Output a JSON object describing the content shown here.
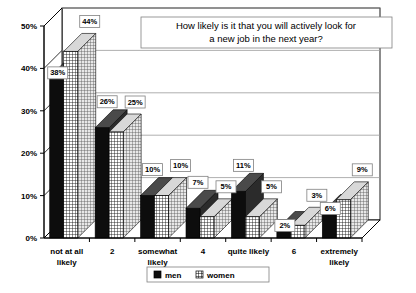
{
  "chart_data": {
    "type": "bar",
    "title": "How likely is it that you will actively look for a new job in the next year?",
    "title_line1": "How likely is it that you will actively look for",
    "title_line2": "a new job in the next year?",
    "xlabel": "",
    "ylabel": "",
    "ylim": [
      0,
      50
    ],
    "ytick_labels": [
      "0%",
      "10%",
      "20%",
      "30%",
      "40%",
      "50%"
    ],
    "ytick_values": [
      0,
      10,
      20,
      30,
      40,
      50
    ],
    "grid": true,
    "legend_position": "bottom-center",
    "categories": [
      "not at all likely",
      "2",
      "somewhat likely",
      "4",
      "quite likely",
      "6",
      "extremely likely"
    ],
    "category_lines": [
      [
        "not at all",
        "likely"
      ],
      [
        "2",
        ""
      ],
      [
        "somewhat",
        "likely"
      ],
      [
        "4",
        ""
      ],
      [
        "quite likely",
        ""
      ],
      [
        "6",
        ""
      ],
      [
        "extremely",
        "likely"
      ]
    ],
    "series": [
      {
        "name": "men",
        "values": [
          38,
          26,
          10,
          7,
          11,
          2,
          6
        ],
        "labels": [
          "38%",
          "26%",
          "10%",
          "7%",
          "11%",
          "2%",
          "6%"
        ],
        "fill": "solid-black"
      },
      {
        "name": "women",
        "values": [
          44,
          25,
          10,
          5,
          5,
          3,
          9
        ],
        "labels": [
          "44%",
          "25%",
          "10%",
          "5%",
          "5%",
          "3%",
          "9%"
        ],
        "fill": "crosshatch"
      }
    ]
  },
  "legend": {
    "items": [
      {
        "label": "men",
        "swatch": "solid-black"
      },
      {
        "label": "women",
        "swatch": "crosshatch"
      }
    ]
  },
  "colors": {
    "men": "#0d0d0d",
    "women": "#ffffff",
    "grid": "#9a9a9a",
    "axis": "#000000",
    "background": "#ffffff"
  }
}
